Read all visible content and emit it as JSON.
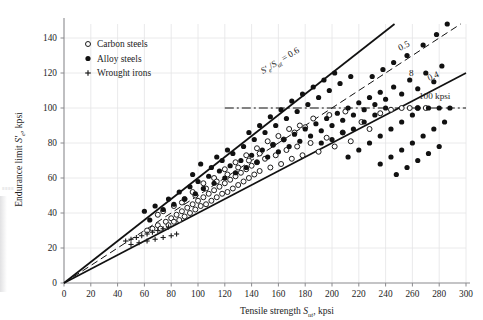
{
  "figure": {
    "name": "endurance-limit-vs-tensile-strength-scatter",
    "xlabel_pre": "Tensile strength ",
    "xlabel_sym": "S",
    "xlabel_sub": "ut",
    "xlabel_post": ", kpsi",
    "ylabel_pre": "Endurance limit ",
    "ylabel_sym": "S",
    "ylabel_prime": "′",
    "ylabel_sub": "e",
    "ylabel_post": ", kpsi"
  },
  "axes": {
    "xlim": [
      0,
      300
    ],
    "ylim": [
      0,
      148
    ],
    "xticks": [
      0,
      20,
      40,
      60,
      80,
      100,
      120,
      140,
      160,
      180,
      200,
      220,
      240,
      260,
      280,
      300
    ],
    "yticks": [
      0,
      20,
      40,
      60,
      80,
      100,
      120,
      140
    ],
    "xtick_labels": [
      "0",
      "20",
      "40",
      "60",
      "80",
      "100",
      "120",
      "140",
      "160",
      "180",
      "200",
      "220",
      "240",
      "260",
      "280",
      "300"
    ],
    "ytick_labels": [
      "0",
      "20",
      "40",
      "60",
      "80",
      "100",
      "120",
      "140"
    ],
    "grid": true,
    "grid_color": "#e4e4e6",
    "axis_color": "#8a8a8e"
  },
  "legend": {
    "position": "upper-left-inside",
    "entries": [
      {
        "marker": "open-circle",
        "label": "Carbon steels"
      },
      {
        "marker": "filled-circle",
        "label": "Alloy steels"
      },
      {
        "marker": "plus",
        "label": "Wrought irons"
      }
    ]
  },
  "annotations": {
    "ratio_main_num": "S",
    "ratio_main_prime": "′",
    "ratio_main_num_sub": "e",
    "ratio_main_den": "S",
    "ratio_main_den_sub": "ut",
    "ratio_main_eq": "= 0.6",
    "ratio_05": "0.5",
    "ratio_04": "0.4",
    "figure_number": "8",
    "cap_line": "100 kpsi"
  },
  "chart_data": {
    "type": "scatter",
    "title": "",
    "xlabel": "Tensile strength S_ut, kpsi",
    "ylabel": "Endurance limit S'_e, kpsi",
    "xlim": [
      0,
      300
    ],
    "ylim": [
      0,
      148
    ],
    "grid": true,
    "legend_position": "upper left",
    "reference_lines": [
      {
        "name": "ratio-0.6",
        "type": "line",
        "slope": 0.6,
        "intercept": 0,
        "style": "solid",
        "label": "S'e/Sut = 0.6"
      },
      {
        "name": "ratio-0.5",
        "type": "line",
        "slope": 0.5,
        "intercept": 0,
        "style": "dashed",
        "label": "0.5"
      },
      {
        "name": "ratio-0.4",
        "type": "line",
        "slope": 0.4,
        "intercept": 0,
        "style": "solid",
        "label": "0.4"
      },
      {
        "name": "cap-100-kpsi",
        "type": "hline",
        "y": 100,
        "style": "dash-dot",
        "label": "100 kpsi",
        "xstart": 120,
        "xend": 300
      }
    ],
    "series": [
      {
        "name": "Carbon steels",
        "marker": "open-circle",
        "color": "#1d1d1d",
        "points": [
          [
            62,
            30
          ],
          [
            66,
            31
          ],
          [
            70,
            33
          ],
          [
            72,
            31
          ],
          [
            76,
            35
          ],
          [
            78,
            33
          ],
          [
            80,
            37
          ],
          [
            82,
            35
          ],
          [
            84,
            39
          ],
          [
            86,
            36
          ],
          [
            88,
            41
          ],
          [
            90,
            38
          ],
          [
            92,
            43
          ],
          [
            94,
            40
          ],
          [
            96,
            45
          ],
          [
            98,
            42
          ],
          [
            100,
            47
          ],
          [
            102,
            44
          ],
          [
            104,
            49
          ],
          [
            106,
            45
          ],
          [
            108,
            51
          ],
          [
            110,
            47
          ],
          [
            112,
            53
          ],
          [
            114,
            49
          ],
          [
            116,
            55
          ],
          [
            118,
            51
          ],
          [
            120,
            57
          ],
          [
            122,
            52
          ],
          [
            124,
            59
          ],
          [
            126,
            54
          ],
          [
            128,
            61
          ],
          [
            130,
            56
          ],
          [
            132,
            63
          ],
          [
            134,
            58
          ],
          [
            136,
            65
          ],
          [
            138,
            60
          ],
          [
            140,
            67
          ],
          [
            142,
            62
          ],
          [
            144,
            69
          ],
          [
            146,
            64
          ],
          [
            150,
            71
          ],
          [
            154,
            66
          ],
          [
            158,
            73
          ],
          [
            162,
            68
          ],
          [
            166,
            76
          ],
          [
            170,
            71
          ],
          [
            174,
            78
          ],
          [
            178,
            73
          ],
          [
            184,
            80
          ],
          [
            190,
            75
          ],
          [
            196,
            83
          ],
          [
            202,
            78
          ],
          [
            208,
            86
          ],
          [
            214,
            81
          ],
          [
            222,
            92
          ],
          [
            228,
            88
          ],
          [
            236,
            97
          ],
          [
            244,
            99
          ],
          [
            252,
            100
          ],
          [
            258,
            100
          ],
          [
            264,
            100
          ],
          [
            270,
            100
          ],
          [
            88,
            46
          ],
          [
            96,
            52
          ],
          [
            104,
            57
          ],
          [
            112,
            60
          ],
          [
            120,
            65
          ],
          [
            128,
            69
          ],
          [
            136,
            73
          ],
          [
            144,
            77
          ],
          [
            152,
            81
          ],
          [
            160,
            84
          ],
          [
            168,
            88
          ],
          [
            176,
            90
          ],
          [
            186,
            94
          ],
          [
            198,
            96
          ],
          [
            210,
            98
          ],
          [
            70,
            39
          ],
          [
            74,
            41
          ],
          [
            82,
            44
          ],
          [
            90,
            48
          ],
          [
            98,
            50
          ],
          [
            106,
            54
          ],
          [
            114,
            58
          ],
          [
            122,
            62
          ],
          [
            130,
            66
          ],
          [
            138,
            70
          ],
          [
            146,
            74
          ],
          [
            156,
            79
          ],
          [
            164,
            82
          ],
          [
            172,
            86
          ],
          [
            180,
            89
          ]
        ]
      },
      {
        "name": "Alloy steels",
        "marker": "filled-circle",
        "color": "#111111",
        "points": [
          [
            60,
            41
          ],
          [
            64,
            36
          ],
          [
            68,
            44
          ],
          [
            74,
            42
          ],
          [
            78,
            48
          ],
          [
            82,
            45
          ],
          [
            86,
            52
          ],
          [
            90,
            48
          ],
          [
            94,
            55
          ],
          [
            98,
            51
          ],
          [
            100,
            58
          ],
          [
            104,
            54
          ],
          [
            108,
            61
          ],
          [
            112,
            57
          ],
          [
            116,
            64
          ],
          [
            120,
            60
          ],
          [
            124,
            67
          ],
          [
            128,
            63
          ],
          [
            132,
            70
          ],
          [
            136,
            66
          ],
          [
            140,
            73
          ],
          [
            144,
            69
          ],
          [
            148,
            76
          ],
          [
            152,
            72
          ],
          [
            156,
            79
          ],
          [
            160,
            75
          ],
          [
            164,
            82
          ],
          [
            168,
            78
          ],
          [
            172,
            85
          ],
          [
            176,
            81
          ],
          [
            180,
            88
          ],
          [
            184,
            84
          ],
          [
            188,
            91
          ],
          [
            192,
            87
          ],
          [
            196,
            94
          ],
          [
            200,
            90
          ],
          [
            204,
            97
          ],
          [
            208,
            93
          ],
          [
            212,
            100
          ],
          [
            216,
            96
          ],
          [
            220,
            103
          ],
          [
            224,
            99
          ],
          [
            228,
            106
          ],
          [
            232,
            102
          ],
          [
            236,
            109
          ],
          [
            240,
            105
          ],
          [
            246,
            112
          ],
          [
            252,
            108
          ],
          [
            258,
            116
          ],
          [
            264,
            111
          ],
          [
            270,
            120
          ],
          [
            276,
            115
          ],
          [
            282,
            124
          ],
          [
            286,
            148
          ],
          [
            110,
            66
          ],
          [
            118,
            70
          ],
          [
            126,
            74
          ],
          [
            134,
            78
          ],
          [
            142,
            82
          ],
          [
            150,
            86
          ],
          [
            158,
            90
          ],
          [
            166,
            94
          ],
          [
            174,
            98
          ],
          [
            182,
            102
          ],
          [
            190,
            106
          ],
          [
            198,
            110
          ],
          [
            206,
            114
          ],
          [
            214,
            118
          ],
          [
            96,
            62
          ],
          [
            102,
            68
          ],
          [
            114,
            72
          ],
          [
            122,
            76
          ],
          [
            138,
            86
          ],
          [
            146,
            90
          ],
          [
            154,
            95
          ],
          [
            162,
            99
          ],
          [
            170,
            104
          ],
          [
            178,
            108
          ],
          [
            186,
            112
          ],
          [
            194,
            116
          ],
          [
            202,
            120
          ],
          [
            192,
            80
          ],
          [
            200,
            82
          ],
          [
            208,
            86
          ],
          [
            216,
            88
          ],
          [
            224,
            92
          ],
          [
            232,
            96
          ],
          [
            240,
            100
          ],
          [
            212,
            72
          ],
          [
            220,
            76
          ],
          [
            228,
            80
          ],
          [
            236,
            84
          ],
          [
            244,
            88
          ],
          [
            252,
            92
          ],
          [
            260,
            96
          ],
          [
            236,
            68
          ],
          [
            244,
            72
          ],
          [
            252,
            76
          ],
          [
            260,
            80
          ],
          [
            268,
            84
          ],
          [
            276,
            88
          ],
          [
            284,
            92
          ],
          [
            248,
            62
          ],
          [
            256,
            66
          ],
          [
            264,
            70
          ],
          [
            272,
            74
          ],
          [
            280,
            78
          ],
          [
            264,
            100
          ],
          [
            272,
            100
          ],
          [
            280,
            100
          ],
          [
            288,
            100
          ],
          [
            230,
            118
          ],
          [
            238,
            122
          ],
          [
            246,
            126
          ],
          [
            256,
            130
          ],
          [
            268,
            136
          ],
          [
            278,
            142
          ]
        ]
      },
      {
        "name": "Wrought irons",
        "marker": "plus",
        "color": "#1d1d1d",
        "points": [
          [
            46,
            24
          ],
          [
            50,
            25
          ],
          [
            54,
            26
          ],
          [
            58,
            27
          ],
          [
            62,
            28
          ],
          [
            66,
            29
          ],
          [
            70,
            30
          ],
          [
            74,
            31
          ],
          [
            78,
            32
          ],
          [
            50,
            22
          ],
          [
            56,
            23
          ],
          [
            62,
            24
          ],
          [
            68,
            25
          ],
          [
            74,
            26
          ],
          [
            80,
            27
          ],
          [
            84,
            28
          ]
        ]
      }
    ]
  }
}
